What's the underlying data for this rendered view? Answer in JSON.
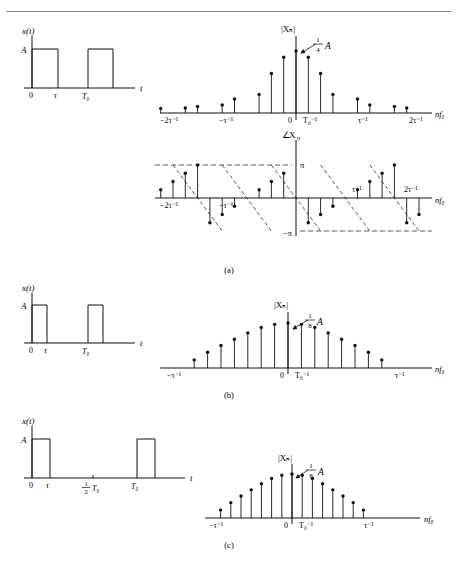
{
  "figure": {
    "top_rule": true,
    "panels": [
      {
        "id": "a",
        "letter": "(a)",
        "time_plot": {
          "ylabel": "x(t)",
          "amplitude_label": "A",
          "xlabel": "t",
          "ticks": [
            "0",
            "τ",
            "T₀"
          ],
          "duty_cycle": 0.25,
          "pulses": [
            {
              "start": 0,
              "end": 0.25
            },
            {
              "start": 1.0,
              "end": 1.25
            }
          ]
        },
        "magnitude_plot": {
          "ylabel": "|Xₙ|",
          "peak_label": "¼A",
          "peak_fraction_num": "1",
          "peak_fraction_den": "4",
          "xlabel": "nf₀",
          "ticks": [
            "−2τ⁻¹",
            "−τ⁻¹",
            "0",
            "T₀⁻¹",
            "τ⁻¹",
            "2τ⁻¹"
          ],
          "envelope": "sinc",
          "lines_per_lobe": 4
        },
        "phase_plot": {
          "ylabel": "∠Xₙ",
          "xlabel": "nf₀",
          "ylim_labels": [
            "π",
            "−π"
          ],
          "ticks": [
            "−2τ⁻¹",
            "−τ⁻¹",
            "τ⁻¹",
            "2τ⁻¹"
          ],
          "shape": "sawtooth",
          "dashed_guides": true
        }
      },
      {
        "id": "b",
        "letter": "(b)",
        "time_plot": {
          "ylabel": "x(t)",
          "amplitude_label": "A",
          "xlabel": "t",
          "ticks": [
            "0",
            "τ",
            "T₀"
          ],
          "duty_cycle": 0.125,
          "pulses": [
            {
              "start": 0,
              "end": 0.125
            },
            {
              "start": 1.0,
              "end": 1.125
            }
          ]
        },
        "magnitude_plot": {
          "ylabel": "|Xₙ|",
          "peak_label": "⅛A",
          "peak_fraction_num": "1",
          "peak_fraction_den": "8",
          "xlabel": "nf₀",
          "ticks": [
            "−τ⁻¹",
            "0",
            "T₀⁻¹",
            "τ⁻¹"
          ],
          "envelope": "sinc",
          "lines_per_lobe": 8
        }
      },
      {
        "id": "c",
        "letter": "(c)",
        "time_plot": {
          "ylabel": "x(t)",
          "amplitude_label": "A",
          "xlabel": "t",
          "ticks": [
            "0",
            "τ",
            "½T₀",
            "T₀"
          ],
          "half_period_num": "1",
          "half_period_den": "2",
          "half_period_sym": "T₀",
          "duty_cycle": 0.125,
          "pulses": [
            {
              "start": 0,
              "end": 0.125
            },
            {
              "start": 1.0,
              "end": 1.125
            }
          ]
        },
        "magnitude_plot": {
          "ylabel": "|Xₙ|",
          "peak_label": "⅛A",
          "peak_fraction_num": "1",
          "peak_fraction_den": "8",
          "xlabel": "nf₀",
          "ticks": [
            "−τ⁻¹",
            "0",
            "T₀⁻¹",
            "τ⁻¹"
          ],
          "envelope": "sinc",
          "lines_per_lobe": 8
        }
      }
    ]
  },
  "chart_data": {
    "type": "line",
    "charts": [
      {
        "name": "panel-a-magnitude",
        "type": "bar",
        "xlabel": "nf₀",
        "ylabel": "|Xₙ|",
        "peak_value_label": "¼A",
        "x_ticks": [
          "−2τ⁻¹",
          "−τ⁻¹",
          "0",
          "T₀⁻¹",
          "τ⁻¹",
          "2τ⁻¹"
        ],
        "n": [
          -11,
          -10,
          -9,
          -8,
          -7,
          -6,
          -5,
          -4,
          -3,
          -2,
          -1,
          0,
          1,
          2,
          3,
          4,
          5,
          6,
          7,
          8,
          9,
          10,
          11
        ],
        "values": [
          0.072,
          0.0,
          0.08,
          0.106,
          0.0,
          0.128,
          0.225,
          0.0,
          0.3,
          0.637,
          0.9,
          1.0,
          0.9,
          0.637,
          0.3,
          0.0,
          0.225,
          0.128,
          0.0,
          0.106,
          0.08,
          0.0,
          0.072
        ]
      },
      {
        "name": "panel-a-phase",
        "type": "bar",
        "xlabel": "nf₀",
        "ylabel": "∠Xₙ",
        "ylim": [
          -3.14159,
          3.14159
        ],
        "y_ticks": [
          "π",
          "−π"
        ],
        "x_ticks": [
          "−2τ⁻¹",
          "−τ⁻¹",
          "τ⁻¹",
          "2τ⁻¹"
        ],
        "n": [
          -11,
          -10,
          -9,
          -8,
          -7,
          -6,
          -5,
          -4,
          -3,
          -2,
          -1,
          0,
          1,
          2,
          3,
          4,
          5,
          6,
          7,
          8,
          9,
          10,
          11
        ],
        "values": [
          0.78,
          1.57,
          2.36,
          3.14,
          -2.36,
          -1.57,
          -0.78,
          0.0,
          0.78,
          1.57,
          2.36,
          0.0,
          -2.36,
          -1.57,
          -0.78,
          0.0,
          0.78,
          1.57,
          2.36,
          3.14,
          -2.36,
          -1.57,
          -0.78
        ]
      },
      {
        "name": "panel-b-magnitude",
        "type": "bar",
        "xlabel": "nf₀",
        "ylabel": "|Xₙ|",
        "peak_value_label": "⅛A",
        "x_ticks": [
          "−τ⁻¹",
          "0",
          "T₀⁻¹",
          "τ⁻¹"
        ],
        "n": [
          -8,
          -7,
          -6,
          -5,
          -4,
          -3,
          -2,
          -1,
          0,
          1,
          2,
          3,
          4,
          5,
          6,
          7,
          8
        ],
        "values": [
          0.0,
          0.18,
          0.35,
          0.5,
          0.64,
          0.78,
          0.9,
          0.97,
          1.0,
          0.97,
          0.9,
          0.78,
          0.64,
          0.5,
          0.35,
          0.18,
          0.0
        ]
      },
      {
        "name": "panel-c-magnitude",
        "type": "bar",
        "xlabel": "nf₀",
        "ylabel": "|Xₙ|",
        "peak_value_label": "⅛A",
        "x_ticks": [
          "−τ⁻¹",
          "0",
          "T₀⁻¹",
          "τ⁻¹"
        ],
        "n": [
          -8,
          -7,
          -6,
          -5,
          -4,
          -3,
          -2,
          -1,
          0,
          1,
          2,
          3,
          4,
          5,
          6,
          7,
          8
        ],
        "values": [
          0.0,
          0.18,
          0.35,
          0.5,
          0.64,
          0.78,
          0.9,
          0.97,
          1.0,
          0.97,
          0.9,
          0.78,
          0.64,
          0.5,
          0.35,
          0.18,
          0.0
        ]
      }
    ]
  }
}
